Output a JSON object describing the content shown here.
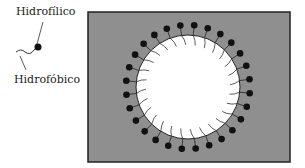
{
  "legend": {
    "hydrophilic_label": "Hidrofílico",
    "hydrophobic_label": "Hidrofóbico"
  },
  "diagram": {
    "type": "micelle",
    "background_color": "#8f8f8f",
    "core_color": "#ffffff",
    "head_color": "#111111",
    "molecule_count": 28
  }
}
